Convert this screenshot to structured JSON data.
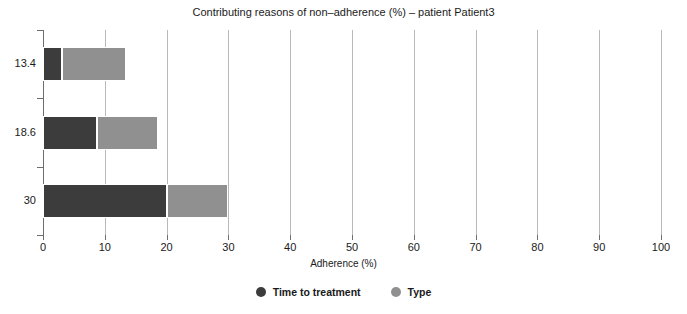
{
  "chart_data": {
    "type": "bar",
    "orientation": "horizontal",
    "stacked": true,
    "title": "Contributing reasons of non–adherence (%) – patient Patient3",
    "xlabel": "Adherence (%)",
    "ylabel": "",
    "xlim": [
      0,
      100
    ],
    "xticks": [
      0,
      10,
      20,
      30,
      40,
      50,
      60,
      70,
      80,
      90,
      100
    ],
    "xticklabels": [
      "0",
      "10",
      "20",
      "30",
      "40",
      "50",
      "60",
      "70",
      "80",
      "90",
      "100"
    ],
    "categories": [
      "13.4",
      "18.6",
      "30"
    ],
    "grid": "vertical",
    "legend_position": "bottom",
    "series": [
      {
        "name": "Time to treatment",
        "color": "#3c3c3c",
        "values": [
          3.1,
          8.7,
          20.0
        ]
      },
      {
        "name": "Type",
        "color": "#909090",
        "values": [
          10.3,
          9.9,
          10.0
        ]
      }
    ],
    "totals": [
      13.4,
      18.6,
      30.0
    ]
  },
  "axis": {
    "x_title": "Adherence (%)",
    "tick_labels_x": [
      "0",
      "10",
      "20",
      "30",
      "40",
      "50",
      "60",
      "70",
      "80",
      "90",
      "100"
    ],
    "tick_labels_y": [
      "13.4",
      "18.6",
      "30"
    ]
  },
  "legend": {
    "items": [
      {
        "label": "Time to treatment",
        "color": "#3c3c3c"
      },
      {
        "label": "Type",
        "color": "#909090"
      }
    ]
  },
  "colors": {
    "series_dark": "#3c3c3c",
    "series_light": "#909090",
    "gridline": "#b9b9b9",
    "axis": "#6e6e6e",
    "text": "#1a1a1a",
    "background": "#ffffff"
  }
}
